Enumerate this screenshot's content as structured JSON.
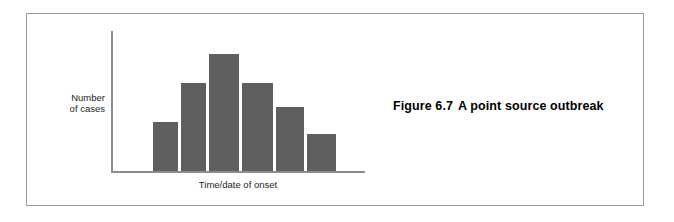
{
  "figure": {
    "caption_number": "Figure 6.7",
    "caption_title": "A point source outbreak",
    "frame_color": "#9a9a9a",
    "background": "#ffffff"
  },
  "chart_data": {
    "type": "bar",
    "title": "",
    "subtitle": "",
    "xlabel": "Time/date of onset",
    "ylabel": "Number of cases",
    "ylabel_lines": [
      "Number",
      "of cases"
    ],
    "categories": [
      "1",
      "2",
      "3",
      "4",
      "5",
      "6"
    ],
    "values": [
      49,
      88,
      117,
      88,
      64,
      37
    ],
    "ylim": [
      0,
      141
    ],
    "xlim": [
      0,
      254
    ],
    "grid": false,
    "legend": "none",
    "bar_color": "#5f5f5f",
    "axis_color": "#8d8d8d",
    "tick_labels_x": [],
    "tick_labels_y": [],
    "annotations": [],
    "bar_geometry": [
      {
        "left": 42,
        "width": 25,
        "height": 49
      },
      {
        "left": 70,
        "width": 25,
        "height": 88
      },
      {
        "left": 98,
        "width": 30,
        "height": 117
      },
      {
        "left": 131,
        "width": 31,
        "height": 88
      },
      {
        "left": 165,
        "width": 28,
        "height": 64
      },
      {
        "left": 196,
        "width": 29,
        "height": 37
      }
    ]
  }
}
